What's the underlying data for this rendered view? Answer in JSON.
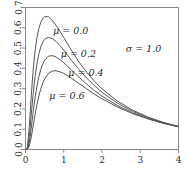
{
  "chart_data": {
    "type": "line",
    "title": "",
    "xlabel": "",
    "ylabel": "",
    "xlim": [
      0,
      4
    ],
    "ylim": [
      0,
      0.7
    ],
    "grid": false,
    "legend_position": "inline-annotations",
    "x_ticks": [
      "0",
      "1",
      "2",
      "3",
      "4"
    ],
    "x_tick_values": [
      0,
      1,
      2,
      3,
      4
    ],
    "y_ticks": [
      "0.0",
      "0.1",
      "0.2",
      "0.3",
      "0.4",
      "0.5",
      "0.6",
      "0.7"
    ],
    "y_tick_values": [
      0.0,
      0.1,
      0.2,
      0.3,
      0.4,
      0.5,
      0.6,
      0.7
    ],
    "annotations": [
      {
        "text": "μ = 0.0",
        "x": 0.72,
        "y": 0.585
      },
      {
        "text": "μ = 0.2",
        "x": 0.92,
        "y": 0.475
      },
      {
        "text": "μ = 0.4",
        "x": 1.12,
        "y": 0.378
      },
      {
        "text": "μ = 0.6",
        "x": 0.62,
        "y": 0.268
      },
      {
        "text": "σ = 1.0",
        "x": 2.62,
        "y": 0.498
      }
    ],
    "series": [
      {
        "name": "μ = 0.0",
        "mu": 0.0,
        "sigma": 1.0,
        "peak_x": 0.37,
        "peak_y": 0.655,
        "x": [
          0.01,
          0.05,
          0.1,
          0.15,
          0.2,
          0.25,
          0.3,
          0.35,
          0.4,
          0.45,
          0.5,
          0.6,
          0.7,
          0.8,
          0.9,
          1.0,
          1.2,
          1.4,
          1.6,
          1.8,
          2.0,
          2.4,
          2.8,
          3.2,
          3.6,
          4.0
        ],
        "y": [
          0.0,
          0.009,
          0.112,
          0.264,
          0.391,
          0.486,
          0.552,
          0.597,
          0.627,
          0.645,
          0.655,
          0.654,
          0.637,
          0.612,
          0.583,
          0.552,
          0.489,
          0.431,
          0.381,
          0.337,
          0.299,
          0.239,
          0.194,
          0.16,
          0.134,
          0.114
        ]
      },
      {
        "name": "μ = 0.2",
        "mu": 0.2,
        "sigma": 1.0,
        "peak_x": 0.45,
        "peak_y": 0.536,
        "x": [
          0.01,
          0.05,
          0.1,
          0.15,
          0.2,
          0.25,
          0.3,
          0.35,
          0.4,
          0.45,
          0.5,
          0.6,
          0.7,
          0.8,
          0.9,
          1.0,
          1.2,
          1.4,
          1.6,
          1.8,
          2.0,
          2.4,
          2.8,
          3.2,
          3.6,
          4.0
        ],
        "y": [
          0.0,
          0.004,
          0.064,
          0.171,
          0.274,
          0.359,
          0.424,
          0.472,
          0.506,
          0.529,
          0.544,
          0.553,
          0.547,
          0.532,
          0.512,
          0.49,
          0.44,
          0.394,
          0.352,
          0.315,
          0.282,
          0.229,
          0.188,
          0.157,
          0.132,
          0.113
        ]
      },
      {
        "name": "μ = 0.4",
        "mu": 0.4,
        "sigma": 1.0,
        "peak_x": 0.55,
        "peak_y": 0.438,
        "x": [
          0.01,
          0.05,
          0.1,
          0.15,
          0.2,
          0.25,
          0.3,
          0.35,
          0.4,
          0.45,
          0.5,
          0.6,
          0.7,
          0.8,
          0.9,
          1.0,
          1.2,
          1.4,
          1.6,
          1.8,
          2.0,
          2.4,
          2.8,
          3.2,
          3.6,
          4.0
        ],
        "y": [
          0.0,
          0.002,
          0.034,
          0.105,
          0.184,
          0.255,
          0.313,
          0.359,
          0.395,
          0.421,
          0.44,
          0.46,
          0.463,
          0.456,
          0.443,
          0.428,
          0.392,
          0.356,
          0.322,
          0.291,
          0.263,
          0.217,
          0.181,
          0.152,
          0.129,
          0.111
        ]
      },
      {
        "name": "μ = 0.6",
        "mu": 0.6,
        "sigma": 1.0,
        "peak_x": 0.67,
        "peak_y": 0.358,
        "x": [
          0.01,
          0.05,
          0.1,
          0.15,
          0.2,
          0.25,
          0.3,
          0.35,
          0.4,
          0.45,
          0.5,
          0.6,
          0.7,
          0.8,
          0.9,
          1.0,
          1.2,
          1.4,
          1.6,
          1.8,
          2.0,
          2.4,
          2.8,
          3.2,
          3.6,
          4.0
        ],
        "y": [
          0.0,
          0.001,
          0.017,
          0.06,
          0.116,
          0.172,
          0.222,
          0.264,
          0.299,
          0.327,
          0.348,
          0.375,
          0.387,
          0.388,
          0.383,
          0.375,
          0.352,
          0.325,
          0.299,
          0.273,
          0.25,
          0.21,
          0.177,
          0.151,
          0.13,
          0.113
        ]
      }
    ]
  },
  "axis": {
    "x_tick_labels": [
      "0",
      "1",
      "2",
      "3",
      "4"
    ],
    "y_tick_labels": [
      "0.0",
      "0.1",
      "0.2",
      "0.3",
      "0.4",
      "0.5",
      "0.6",
      "0.7"
    ]
  },
  "colors": {
    "curve": "#555555",
    "frame": "#8a8a8a",
    "text": "#2b2b2b",
    "background": "#ffffff"
  }
}
